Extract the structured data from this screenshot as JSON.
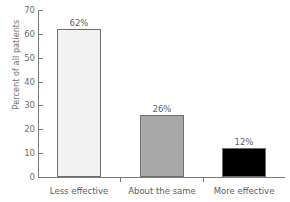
{
  "chart_data": {
    "type": "bar",
    "title": "",
    "subtitle": "",
    "xlabel": "",
    "ylabel": "Percent of all patients",
    "categories": [
      "Less effective",
      "About the same",
      "More effective"
    ],
    "values": [
      62,
      26,
      12
    ],
    "data_labels": [
      "62%",
      "26%",
      "12%"
    ],
    "ylim": [
      0,
      70
    ],
    "ytick_values": [
      0,
      10,
      20,
      30,
      40,
      50,
      60,
      70
    ],
    "ytick_labels": [
      "0",
      "10",
      "20",
      "30",
      "40",
      "50",
      "60",
      "70"
    ],
    "grid": false,
    "legend": false,
    "legend_position": "none",
    "series": [
      {
        "name": "Percent of all patients",
        "values": [
          62,
          26,
          12
        ]
      }
    ],
    "bar_colors": [
      "#f2f2f2",
      "#a8a8a8",
      "#000000"
    ],
    "bar_edge_color": "#6f6f6f",
    "axis_color": "#777777",
    "text_color": "#5d5d5d"
  },
  "axes": {
    "y_title": "Percent of all patients"
  }
}
